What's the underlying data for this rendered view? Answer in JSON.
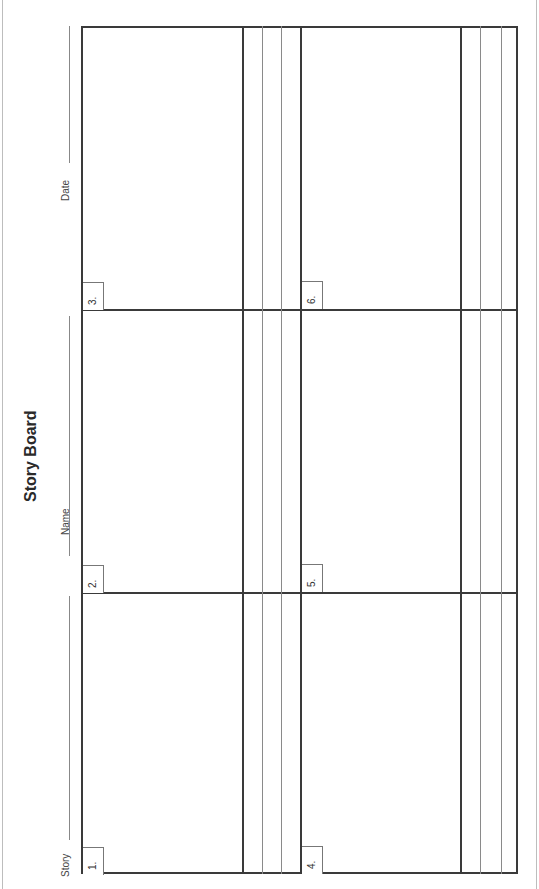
{
  "document": {
    "title": "Story Board",
    "orientation": "rotated-90-ccw",
    "fields": {
      "story_label": "Story",
      "name_label": "Name",
      "date_label": "Date"
    },
    "panels": [
      {
        "number": "1."
      },
      {
        "number": "2."
      },
      {
        "number": "3."
      },
      {
        "number": "4."
      },
      {
        "number": "5."
      },
      {
        "number": "6."
      }
    ],
    "caption_lines_per_panel": 3
  }
}
